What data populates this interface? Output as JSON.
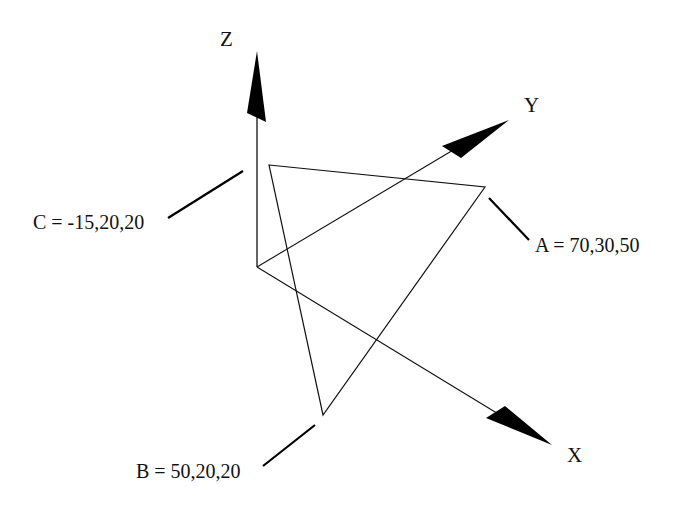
{
  "diagram": {
    "axes": [
      {
        "name": "X",
        "label": "X"
      },
      {
        "name": "Y",
        "label": "Y"
      },
      {
        "name": "Z",
        "label": "Z"
      }
    ],
    "points": [
      {
        "name": "A",
        "label": "A = 70,30,50",
        "coords": [
          70,
          30,
          50
        ]
      },
      {
        "name": "B",
        "label": "B = 50,20,20",
        "coords": [
          50,
          20,
          20
        ]
      },
      {
        "name": "C",
        "label": "C = -15,20,20",
        "coords": [
          -15,
          20,
          20
        ]
      }
    ],
    "colors": {
      "stroke": "#111111",
      "background": "#ffffff"
    }
  }
}
